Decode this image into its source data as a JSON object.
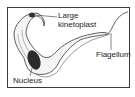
{
  "diagram": {
    "labels": {
      "kinetoplast_line1": "Large",
      "kinetoplast_line2": "kinetoplast",
      "flagellum": "Flagellum",
      "nucleus": "Nucleus"
    },
    "colors": {
      "outline": "#3a3a3a",
      "nucleus": "#2b2b2b",
      "kinetoplast": "#333333"
    }
  }
}
